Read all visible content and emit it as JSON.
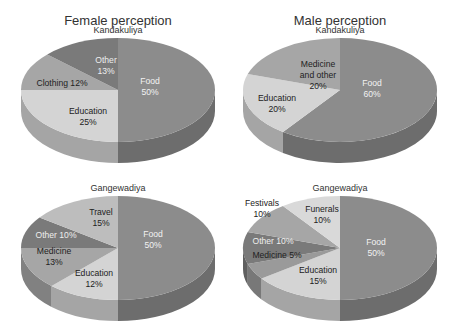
{
  "titles": {
    "female": "Female perception",
    "male": "Male perception"
  },
  "chart_data": [
    {
      "type": "pie",
      "panel": "female",
      "title": "Female perception",
      "subtitle": "Kandakuliya",
      "cx": 118,
      "cy": 90,
      "rx": 97,
      "ry": 52,
      "depth": 21,
      "slices": [
        {
          "label": "Food",
          "value": 50,
          "color": "#8c8c8c",
          "text": [
            "Food",
            "50%"
          ],
          "tx": 150,
          "ty": 84,
          "tc": "#f2f2f2"
        },
        {
          "label": "Education",
          "value": 25,
          "color": "#d4d4d4",
          "text": [
            "Education",
            "25%"
          ],
          "tx": 88,
          "ty": 114,
          "tc": "#222"
        },
        {
          "label": "Clothing",
          "value": 12,
          "color": "#a6a6a6",
          "text": [
            "Clothing 12%"
          ],
          "tx": 62,
          "ty": 86,
          "tc": "#222"
        },
        {
          "label": "Other",
          "value": 13,
          "color": "#7a7a7a",
          "text": [
            "Other",
            "13%"
          ],
          "tx": 106,
          "ty": 63,
          "tc": "#eeeeee"
        }
      ]
    },
    {
      "type": "pie",
      "panel": "male",
      "title": "Male perception",
      "subtitle": "Kandakuliya",
      "cx": 340,
      "cy": 90,
      "rx": 97,
      "ry": 52,
      "depth": 21,
      "slices": [
        {
          "label": "Food",
          "value": 60,
          "color": "#8c8c8c",
          "text": [
            "Food",
            "60%"
          ],
          "tx": 372,
          "ty": 86,
          "tc": "#f2f2f2"
        },
        {
          "label": "Education",
          "value": 20,
          "color": "#d4d4d4",
          "text": [
            "Education",
            "20%"
          ],
          "tx": 277,
          "ty": 101,
          "tc": "#222"
        },
        {
          "label": "Medicine and other",
          "value": 20,
          "color": "#a6a6a6",
          "text": [
            "Medicine",
            "and other",
            "20%"
          ],
          "tx": 318,
          "ty": 67,
          "tc": "#222"
        }
      ]
    },
    {
      "type": "pie",
      "panel": "female",
      "subtitle": "Gangewadiya",
      "cx": 118,
      "cy": 248,
      "rx": 97,
      "ry": 52,
      "depth": 21,
      "slices": [
        {
          "label": "Food",
          "value": 50,
          "color": "#8c8c8c",
          "text": [
            "Food",
            "50%"
          ],
          "tx": 153,
          "ty": 237,
          "tc": "#f2f2f2"
        },
        {
          "label": "Education",
          "value": 12,
          "color": "#d4d4d4",
          "text": [
            "Education",
            "12%"
          ],
          "tx": 94,
          "ty": 276,
          "tc": "#222"
        },
        {
          "label": "Medicine",
          "value": 13,
          "color": "#a6a6a6",
          "text": [
            "Medicine",
            "13%"
          ],
          "tx": 54,
          "ty": 254,
          "tc": "#222"
        },
        {
          "label": "Other",
          "value": 10,
          "color": "#7a7a7a",
          "text": [
            "Other 10%"
          ],
          "tx": 56,
          "ty": 238,
          "tc": "#eeeeee"
        },
        {
          "label": "Travel",
          "value": 15,
          "color": "#bdbdbd",
          "text": [
            "Travel",
            "15%"
          ],
          "tx": 101,
          "ty": 215,
          "tc": "#222"
        }
      ]
    },
    {
      "type": "pie",
      "panel": "male",
      "subtitle": "Gangewadiya",
      "cx": 340,
      "cy": 248,
      "rx": 97,
      "ry": 52,
      "depth": 21,
      "slices": [
        {
          "label": "Food",
          "value": 50,
          "color": "#8c8c8c",
          "text": [
            "Food",
            "50%"
          ],
          "tx": 376,
          "ty": 245,
          "tc": "#f2f2f2"
        },
        {
          "label": "Education",
          "value": 15,
          "color": "#d4d4d4",
          "text": [
            "Education",
            "15%"
          ],
          "tx": 318,
          "ty": 273,
          "tc": "#222"
        },
        {
          "label": "Medicine",
          "value": 5,
          "color": "#9a9a9a",
          "text": [
            "Medicine 5%"
          ],
          "tx": 277,
          "ty": 258,
          "tc": "#222"
        },
        {
          "label": "Other",
          "value": 10,
          "color": "#7a7a7a",
          "text": [
            "Other 10%"
          ],
          "tx": 273,
          "ty": 244,
          "tc": "#eeeeee"
        },
        {
          "label": "Festivals",
          "value": 10,
          "color": "#a6a6a6",
          "text": [
            "Festivals",
            "10%"
          ],
          "tx": 262,
          "ty": 206,
          "tc": "#222"
        },
        {
          "label": "Funerals",
          "value": 10,
          "color": "#d9d9d9",
          "text": [
            "Funerals",
            "10%"
          ],
          "tx": 322,
          "ty": 212,
          "tc": "#222"
        }
      ]
    }
  ]
}
